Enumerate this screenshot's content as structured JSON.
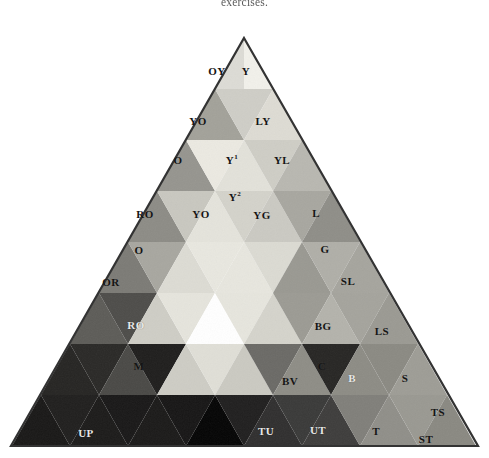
{
  "caption": {
    "text": "exercises."
  },
  "figure": {
    "name": "color-triangle-diagram",
    "type": "triangle-color-chart",
    "rendering": "grayscale halftone scan",
    "background_color": "#ffffff",
    "outline_color": "#3a3a3a",
    "apex": {
      "x": 244,
      "y": 38
    },
    "base_left": {
      "x": 11,
      "y": 446
    },
    "base_right": {
      "x": 478,
      "y": 446
    },
    "center_highlight": {
      "name": "central-white-triangle",
      "color": "#ffffff",
      "orientation": "inverted"
    },
    "labels": [
      {
        "id": "OY",
        "text": "OY",
        "x": 217,
        "y": 71,
        "tone": "dark",
        "fill": "#dddcd6"
      },
      {
        "id": "Y",
        "text": "Y",
        "x": 246,
        "y": 71,
        "tone": "dark",
        "fill": "#f1f0ea"
      },
      {
        "id": "YO1",
        "text": "YO",
        "x": 198,
        "y": 121,
        "tone": "dark",
        "fill": "#a3a29a"
      },
      {
        "id": "LY",
        "text": "LY",
        "x": 263,
        "y": 121,
        "tone": "dark",
        "fill": "#dedcd4"
      },
      {
        "id": "O1",
        "text": "O",
        "x": 178,
        "y": 160,
        "tone": "dark",
        "fill": "#969590"
      },
      {
        "id": "Y1",
        "text": "Y",
        "sup": "1",
        "x": 232,
        "y": 160,
        "tone": "dark",
        "fill": "#ececE4"
      },
      {
        "id": "YL",
        "text": "YL",
        "x": 282,
        "y": 160,
        "tone": "dark",
        "fill": "#cfcec6"
      },
      {
        "id": "Y2",
        "text": "Y",
        "sup": "2",
        "x": 235,
        "y": 197,
        "tone": "dark",
        "fill": "#e4e3db"
      },
      {
        "id": "RO1",
        "text": "RO",
        "x": 145,
        "y": 214,
        "tone": "dark",
        "fill": "#8d8c86"
      },
      {
        "id": "YO2",
        "text": "YO",
        "x": 201,
        "y": 214,
        "tone": "dark",
        "fill": "#d9d8d0"
      },
      {
        "id": "YG",
        "text": "YG",
        "x": 262,
        "y": 215,
        "tone": "dark",
        "fill": "#d4d3cb"
      },
      {
        "id": "L",
        "text": "L",
        "x": 316,
        "y": 213,
        "tone": "dark",
        "fill": "#a8a7a0"
      },
      {
        "id": "O2",
        "text": "O",
        "x": 139,
        "y": 250,
        "tone": "dark",
        "fill": "#7d7c77"
      },
      {
        "id": "G",
        "text": "G",
        "x": 325,
        "y": 249,
        "tone": "dark",
        "fill": "#9a9992"
      },
      {
        "id": "OR",
        "text": "OR",
        "x": 111,
        "y": 282,
        "tone": "dark",
        "fill": "#5e5d59"
      },
      {
        "id": "SL",
        "text": "SL",
        "x": 348,
        "y": 281,
        "tone": "dark",
        "fill": "#acaba4"
      },
      {
        "id": "RO2",
        "text": "RO",
        "x": 136,
        "y": 325,
        "tone": "light",
        "fill": "#2c2b29"
      },
      {
        "id": "BG",
        "text": "BG",
        "x": 323,
        "y": 326,
        "tone": "dark",
        "fill": "#9c9b94"
      },
      {
        "id": "LS",
        "text": "LS",
        "x": 382,
        "y": 331,
        "tone": "dark",
        "fill": "#a5a49d"
      },
      {
        "id": "M",
        "text": "M",
        "x": 139,
        "y": 366,
        "tone": "dark",
        "fill": "#4a4946"
      },
      {
        "id": "C",
        "text": "C",
        "x": 322,
        "y": 366,
        "tone": "dark",
        "fill": "#8e8d86"
      },
      {
        "id": "BV",
        "text": "BV",
        "x": 290,
        "y": 381,
        "tone": "dark",
        "fill": "#6b6a66"
      },
      {
        "id": "B",
        "text": "B",
        "x": 352,
        "y": 378,
        "tone": "light",
        "fill": "#272624"
      },
      {
        "id": "S",
        "text": "S",
        "x": 405,
        "y": 378,
        "tone": "dark",
        "fill": "#8b8a83"
      },
      {
        "id": "UP",
        "text": "UP",
        "x": 86,
        "y": 433,
        "tone": "light",
        "fill": "#201f1e"
      },
      {
        "id": "TU",
        "text": "TU",
        "x": 266,
        "y": 431,
        "tone": "light",
        "fill": "#303030"
      },
      {
        "id": "UT",
        "text": "UT",
        "x": 318,
        "y": 430,
        "tone": "light",
        "fill": "#3a3a3a"
      },
      {
        "id": "T",
        "text": "T",
        "x": 376,
        "y": 431,
        "tone": "dark",
        "fill": "#7f7e79"
      },
      {
        "id": "TS",
        "text": "TS",
        "x": 438,
        "y": 412,
        "tone": "dark",
        "fill": "#9a9992"
      },
      {
        "id": "ST",
        "text": "ST",
        "x": 426,
        "y": 439,
        "tone": "dark",
        "fill": "#908f89"
      }
    ]
  },
  "chart_data": {
    "type": "table",
    "xlabel": "",
    "ylabel": "",
    "categories": [
      "OY",
      "Y",
      "YO",
      "LY",
      "O",
      "Y1",
      "YL",
      "Y2",
      "RO",
      "YO",
      "YG",
      "L",
      "O",
      "G",
      "OR",
      "SL",
      "RO",
      "BG",
      "LS",
      "M",
      "C",
      "BV",
      "B",
      "S",
      "UP",
      "TU",
      "UT",
      "T",
      "TS",
      "ST"
    ],
    "values": [
      221,
      240,
      162,
      221,
      150,
      236,
      206,
      227,
      140,
      216,
      211,
      167,
      124,
      153,
      94,
      172,
      44,
      155,
      164,
      73,
      142,
      106,
      39,
      139,
      32,
      48,
      58,
      127,
      153,
      144
    ],
    "legend": [],
    "grid": false
  }
}
